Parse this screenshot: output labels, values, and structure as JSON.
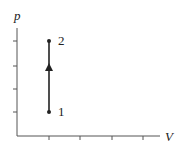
{
  "diagram": {
    "type": "pV-diagram",
    "axes": {
      "y_label": "p",
      "x_label": "V",
      "y_ticks_count": 4,
      "x_ticks_count": 4
    },
    "points": [
      {
        "id": "1",
        "label": "1"
      },
      {
        "id": "2",
        "label": "2"
      }
    ],
    "process": {
      "from": "1",
      "to": "2",
      "kind": "isochoric",
      "arrow_direction": "up"
    },
    "colors": {
      "line": "#222222",
      "axis": "#555555"
    }
  }
}
